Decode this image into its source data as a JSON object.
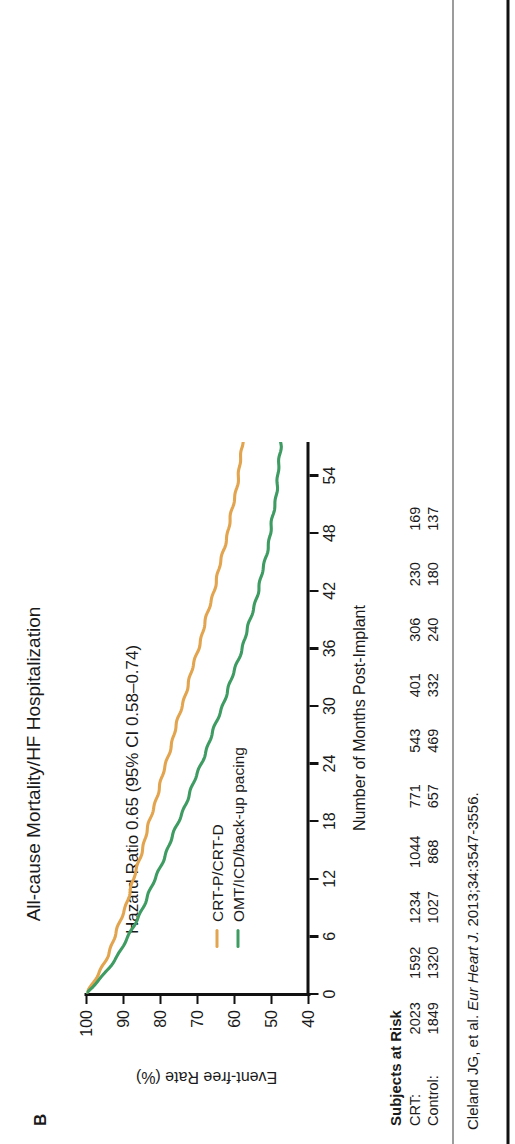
{
  "panel": {
    "letter": "B"
  },
  "header": {
    "title": "All-cause Mortality/HF Hospitalization",
    "hazard_ratio": "Hazard Ratio 0.65 (95% CI 0.58–0.74)"
  },
  "colors": {
    "crt": "#E2A44E",
    "control": "#3E9B62",
    "axis": "#111111",
    "text": "#1a1a1a"
  },
  "legend": {
    "items": [
      {
        "label": "CRT-P/CRT-D",
        "color": "#E2A44E"
      },
      {
        "label": "OMT/ICD/back-up pacing",
        "color": "#3E9B62"
      }
    ]
  },
  "risk": {
    "title": "Subjects at Risk",
    "rows": [
      {
        "label": "CRT:",
        "values": [
          "2023",
          "1592",
          "1234",
          "1044",
          "771",
          "543",
          "401",
          "306",
          "230",
          "169"
        ]
      },
      {
        "label": "Control:",
        "values": [
          "1849",
          "1320",
          "1027",
          "868",
          "657",
          "469",
          "332",
          "240",
          "180",
          "137"
        ]
      }
    ]
  },
  "citation": {
    "prefix": "Cleland JG, et al. ",
    "journal": "Eur Heart J.",
    "suffix": " 2013;34:3547-3556."
  },
  "chart_data": {
    "type": "line",
    "title": "All-cause Mortality/HF Hospitalization",
    "xlabel": "Number of Months Post-Implant",
    "ylabel": "Event-free Rate (%)",
    "xlim": [
      0,
      57.5
    ],
    "ylim": [
      40,
      100
    ],
    "xticks": [
      0,
      6,
      12,
      18,
      24,
      30,
      36,
      42,
      48,
      54
    ],
    "xtick_labels": [
      "0",
      "6",
      "12",
      "18",
      "24",
      "30",
      "36",
      "42",
      "48",
      "54"
    ],
    "yticks": [
      40,
      50,
      60,
      70,
      80,
      90,
      100
    ],
    "ytick_labels": [
      "40",
      "50",
      "60",
      "70",
      "80",
      "90",
      "100"
    ],
    "grid": false,
    "legend_position": "lower-left",
    "annotation": "Hazard Ratio 0.65 (95% CI 0.58–0.74)",
    "series": [
      {
        "name": "CRT-P/CRT-D",
        "color": "#E2A44E",
        "x": [
          0,
          2,
          4,
          6,
          9,
          12,
          15,
          18,
          21,
          24,
          27,
          30,
          33,
          36,
          39,
          42,
          45,
          48,
          51,
          54,
          57
        ],
        "y": [
          100,
          96.8,
          94.3,
          92.3,
          89.6,
          87.2,
          85.0,
          82.9,
          80.7,
          78.5,
          76.4,
          74.2,
          72.0,
          69.8,
          67.7,
          65.6,
          63.7,
          61.9,
          60.3,
          58.9,
          57.9
        ]
      },
      {
        "name": "OMT/ICD/back-up pacing",
        "color": "#3E9B62",
        "x": [
          0,
          2,
          4,
          6,
          9,
          12,
          15,
          18,
          21,
          24,
          27,
          30,
          33,
          36,
          39,
          42,
          45,
          48,
          51,
          54,
          57
        ],
        "y": [
          100,
          95.4,
          91.6,
          88.6,
          84.8,
          81.4,
          78.2,
          75.1,
          72.0,
          69.0,
          66.1,
          63.3,
          60.6,
          58.0,
          55.7,
          53.6,
          51.8,
          50.3,
          49.1,
          48.2,
          47.6
        ]
      }
    ],
    "risk_table": {
      "times": [
        0,
        6,
        12,
        18,
        24,
        30,
        36,
        42,
        48,
        54
      ],
      "rows": [
        {
          "label": "CRT:",
          "values": [
            2023,
            1592,
            1234,
            1044,
            771,
            543,
            401,
            306,
            230,
            169
          ]
        },
        {
          "label": "Control:",
          "values": [
            1849,
            1320,
            1027,
            868,
            657,
            469,
            332,
            240,
            180,
            137
          ]
        }
      ]
    }
  }
}
